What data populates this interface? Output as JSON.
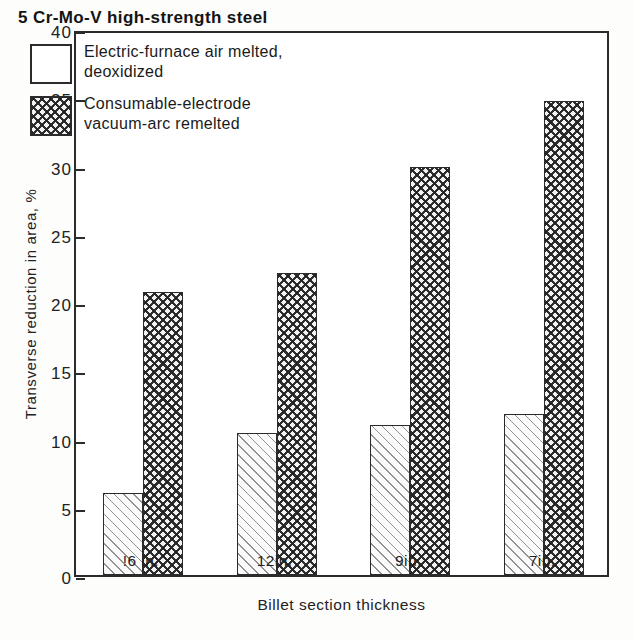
{
  "chart_data": {
    "type": "bar",
    "title": "5 Cr-Mo-V high-strength steel",
    "xlabel": "Billet section thickness",
    "ylabel": "Transverse reduction in area, %",
    "categories": [
      "16 in.",
      "12 in.",
      "9 in.",
      "7 in."
    ],
    "category_labels_as_printed": [
      "!6 in.",
      "12in.",
      "9in.",
      "7in."
    ],
    "series": [
      {
        "name": "Electric-furnace air melted, deoxidized",
        "name_line1": "Electric-furnace air melted,",
        "name_line2": "deoxidized",
        "pattern": "diagonal-hatch",
        "values": [
          6.0,
          10.4,
          11.0,
          11.8
        ]
      },
      {
        "name": "Consumable-electrode vacuum-arc remelted",
        "name_line1": "Consumable-electrode",
        "name_line2": "vacuum-arc remelted",
        "pattern": "cross-hatch",
        "values": [
          20.7,
          22.1,
          29.9,
          34.7
        ]
      }
    ],
    "ylim": [
      0,
      40
    ],
    "yticks": [
      0,
      5,
      10,
      15,
      20,
      25,
      30,
      35,
      40
    ],
    "ytick_labels": [
      "0",
      "5",
      "10",
      "15",
      "20",
      "25",
      "30",
      "35",
      "40"
    ],
    "grid": false,
    "legend_position": "top-left-inside"
  },
  "colors": {
    "axis": "#2b2b2b",
    "text": "#1a1a1a",
    "background": "#ffffff",
    "bar_light_fill": "#fbfbfb",
    "bar_dark_fill": "#f2f2f2"
  }
}
